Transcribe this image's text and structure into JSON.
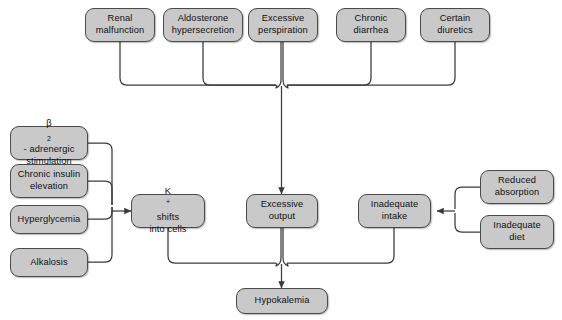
{
  "diagram": {
    "style": {
      "node_fill": "#c9c9c9",
      "node_border": "#4a4a4a",
      "line_color": "#3a3a3a",
      "background": "#ffffff"
    },
    "nodes": {
      "renal_malfunction": {
        "label": "Renal malfunction",
        "line1": "Renal",
        "line2": "malfunction"
      },
      "aldosterone_hypersecretion": {
        "label": "Aldosterone hypersecretion",
        "line1": "Aldosterone",
        "line2": "hypersecretion"
      },
      "excessive_perspiration": {
        "label": "Excessive perspiration",
        "line1": "Excessive",
        "line2": "perspiration"
      },
      "chronic_diarrhea": {
        "label": "Chronic diarrhea",
        "line1": "Chronic",
        "line2": "diarrhea"
      },
      "certain_diuretics": {
        "label": "Certain diuretics",
        "line1": "Certain",
        "line2": "diuretics"
      },
      "beta2_adrenergic_stimulation": {
        "label": "β2- adrenergic stimulation",
        "line1_pre": "β",
        "line1_sub": "2",
        "line1_post": "- adrenergic",
        "line2": "stimulation"
      },
      "chronic_insulin_elevation": {
        "label": "Chronic insulin elevation",
        "line1": "Chronic insulin",
        "line2": "elevation"
      },
      "hyperglycemia": {
        "label": "Hyperglycemia"
      },
      "alkalosis": {
        "label": "Alkalosis"
      },
      "k_shifts_into_cells": {
        "label": "K+ shifts into cells",
        "line1_pre": "K",
        "line1_sup": "+",
        "line1_post": " shifts",
        "line2": "into cells"
      },
      "excessive_output": {
        "label": "Excessive output",
        "line1": "Excessive",
        "line2": "output"
      },
      "inadequate_intake": {
        "label": "Inadequate intake",
        "line1": "Inadequate",
        "line2": "intake"
      },
      "reduced_absorption": {
        "label": "Reduced absorption",
        "line1": "Reduced",
        "line2": "absorption"
      },
      "inadequate_diet": {
        "label": "Inadequate diet",
        "line1": "Inadequate",
        "line2": "diet"
      },
      "hypokalemia": {
        "label": "Hypokalemia"
      }
    }
  }
}
